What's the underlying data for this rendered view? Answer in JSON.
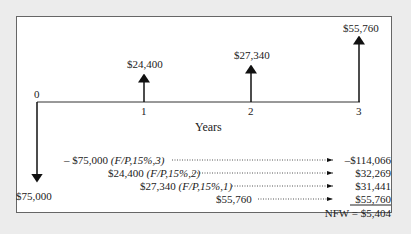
{
  "diagram": {
    "type": "cash-flow-diagram",
    "axis_label": "Years",
    "periods": [
      "0",
      "1",
      "2",
      "3"
    ],
    "cash_flows": [
      {
        "period": "0",
        "label": "$75,000",
        "direction": "down"
      },
      {
        "period": "1",
        "label": "$24,400",
        "direction": "up"
      },
      {
        "period": "2",
        "label": "$27,340",
        "direction": "up"
      },
      {
        "period": "3",
        "label": "$55,760",
        "direction": "up"
      }
    ],
    "calculation": [
      {
        "expr": "– $75,000",
        "factor": "(F/P,15%,3)",
        "result": "–$114,066"
      },
      {
        "expr": "$24,400",
        "factor": "(F/P,15%,2)",
        "result": "$32,269"
      },
      {
        "expr": "$27,340",
        "factor": "(F/P,15%,1)",
        "result": "$31,441"
      },
      {
        "expr": "$55,760",
        "factor": "",
        "result": "$55,760"
      }
    ],
    "total": "NFW = $5,404"
  }
}
